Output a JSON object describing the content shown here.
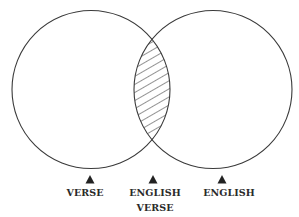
{
  "diagram": {
    "type": "venn",
    "circles": [
      {
        "id": "verse",
        "cx": 91,
        "cy": 89.5,
        "r": 79
      },
      {
        "id": "english",
        "cx": 213,
        "cy": 89.5,
        "r": 79
      }
    ],
    "intersection": {
      "pattern": "diagonal-hatch",
      "meaning": "English verse"
    },
    "stroke_color": "#3a3a3a",
    "marker_color": "#222222",
    "labels": [
      {
        "x": 90,
        "line1": "VERSE",
        "line2": ""
      },
      {
        "x": 153,
        "line1": "ENGLISH",
        "line2": "VERSE"
      },
      {
        "x": 222,
        "line1": "ENGLISH",
        "line2": ""
      }
    ]
  }
}
